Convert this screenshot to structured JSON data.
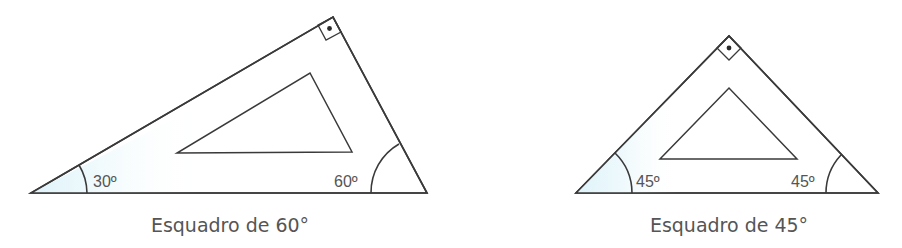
{
  "figures": [
    {
      "id": "set-square-60",
      "caption": "Esquadro de 60°",
      "angles": [
        {
          "label": "30º",
          "degrees": 30,
          "shaded": true
        },
        {
          "label": "60º",
          "degrees": 60,
          "shaded": false
        },
        {
          "label": "",
          "degrees": 90,
          "right_angle_mark": true
        }
      ]
    },
    {
      "id": "set-square-45",
      "caption": "Esquadro de 45°",
      "angles": [
        {
          "label": "45º",
          "degrees": 45,
          "shaded": true
        },
        {
          "label": "45º",
          "degrees": 45,
          "shaded": false
        },
        {
          "label": "",
          "degrees": 90,
          "right_angle_mark": true
        }
      ]
    }
  ],
  "colors": {
    "stroke": "#3a3a3a",
    "shade": "#e6f6fb",
    "text": "#555555"
  }
}
